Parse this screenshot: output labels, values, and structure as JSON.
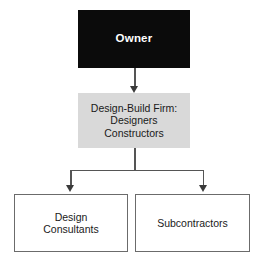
{
  "diagram": {
    "type": "organization-chart",
    "colors": {
      "owner_fill": "#0b0b0b",
      "owner_text": "#ffffff",
      "firm_fill": "#d9d9d9",
      "leaf_fill": "#ffffff",
      "leaf_border": "#6b6b6b",
      "connector": "#555555",
      "arrow_head": "#3a3a3a",
      "background": "#ffffff"
    },
    "nodes": [
      {
        "id": "owner",
        "label": "Owner",
        "tier": 1,
        "style": "filled-black",
        "text_color": "#ffffff",
        "bold": true
      },
      {
        "id": "design_build_firm",
        "label": "Design-Build Firm:\nDesigners\nConstructors",
        "lines": [
          "Design-Build Firm:",
          "Designers",
          "Constructors"
        ],
        "tier": 2,
        "style": "filled-gray",
        "text_color": "#1a1a1a",
        "bold": false
      },
      {
        "id": "design_consultants",
        "label": "Design\nConsultants",
        "lines": [
          "Design",
          "Consultants"
        ],
        "tier": 3,
        "style": "outlined-white",
        "text_color": "#1a1a1a",
        "bold": false
      },
      {
        "id": "subcontractors",
        "label": "Subcontractors",
        "lines": [
          "Subcontractors"
        ],
        "tier": 3,
        "style": "outlined-white",
        "text_color": "#1a1a1a",
        "bold": false
      }
    ],
    "edges": [
      {
        "id": "owner-to-firm",
        "from": "owner",
        "to": "design_build_firm",
        "arrow": "down"
      },
      {
        "id": "firm-to-design-consultants",
        "from": "design_build_firm",
        "to": "design_consultants",
        "arrow": "down"
      },
      {
        "id": "firm-to-subcontractors",
        "from": "design_build_firm",
        "to": "subcontractors",
        "arrow": "down"
      }
    ]
  }
}
